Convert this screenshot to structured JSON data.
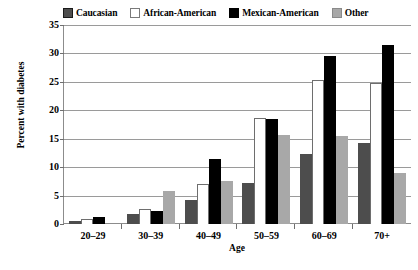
{
  "chart_data": {
    "type": "bar",
    "title": "",
    "xlabel": "Age",
    "ylabel": "Percent with diabetes",
    "ylim": [
      0,
      35
    ],
    "ytick_step": 5,
    "yticks": [
      35,
      30,
      25,
      20,
      15,
      10,
      5,
      0
    ],
    "grid": true,
    "legend_position": "top",
    "categories": [
      "20–29",
      "30–39",
      "40–49",
      "50–59",
      "60–69",
      "70+"
    ],
    "series": [
      {
        "name": "Caucasian",
        "color": "#4d4d4d",
        "swatch": "dark-gray-filled",
        "values": [
          0.6,
          1.8,
          4.2,
          7.2,
          12.3,
          14.2
        ]
      },
      {
        "name": "African-American",
        "color": "#ffffff",
        "swatch": "white-outlined",
        "values": [
          0.9,
          2.7,
          7.0,
          18.7,
          25.3,
          24.8
        ]
      },
      {
        "name": "Mexican-American",
        "color": "#000000",
        "swatch": "black-filled",
        "values": [
          1.2,
          2.3,
          11.5,
          18.4,
          29.6,
          31.4
        ]
      },
      {
        "name": "Other",
        "color": "#a8a8a8",
        "swatch": "light-gray-filled",
        "values": [
          null,
          5.8,
          7.6,
          15.7,
          15.5,
          9.0
        ]
      }
    ]
  },
  "caption": ""
}
